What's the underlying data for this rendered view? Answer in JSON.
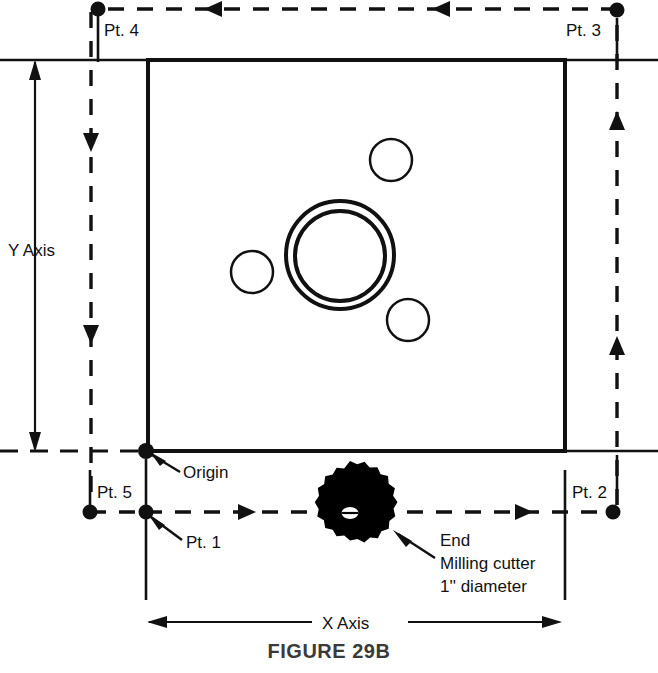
{
  "figure": {
    "caption": "FIGURE 29B",
    "type": "engineering-drawing"
  },
  "labels": {
    "pt4": "Pt. 4",
    "pt3": "Pt. 3",
    "pt5": "Pt. 5",
    "pt1": "Pt. 1",
    "pt2": "Pt. 2",
    "origin": "Origin",
    "y_axis": "Y Axis",
    "x_axis": "X Axis",
    "cutter_line1": "End",
    "cutter_line2": "Milling cutter",
    "cutter_line3": "1'' diameter"
  },
  "colors": {
    "line": "#111111",
    "caption": "#3a3a3a",
    "cutter_fill": "#000000",
    "background": "#ffffff"
  },
  "geometry": {
    "workpiece": {
      "x": 148,
      "y": 60,
      "width": 417,
      "height": 391
    },
    "origin_point": {
      "x": 146,
      "y": 451
    },
    "points": [
      {
        "name": "Pt. 1",
        "x": 146,
        "y": 512
      },
      {
        "name": "Pt. 2",
        "x": 613,
        "y": 512
      },
      {
        "name": "Pt. 3",
        "x": 617,
        "y": 10
      },
      {
        "name": "Pt. 4",
        "x": 98,
        "y": 9
      },
      {
        "name": "Pt. 5",
        "x": 90,
        "y": 512
      }
    ],
    "holes": [
      {
        "name": "large-bore-outer",
        "cx": 340,
        "cy": 255,
        "r": 54
      },
      {
        "name": "large-bore-inner",
        "cx": 340,
        "cy": 256,
        "r": 46
      },
      {
        "name": "small-hole-upper-right",
        "cx": 391,
        "cy": 160,
        "r": 21
      },
      {
        "name": "small-hole-left",
        "cx": 252,
        "cy": 272,
        "r": 21
      },
      {
        "name": "small-hole-lower-right",
        "cx": 408,
        "cy": 320,
        "r": 21
      }
    ],
    "cutter": {
      "cx": 350,
      "cy": 513,
      "r_outer": 52,
      "r_inner": 43,
      "teeth": 23
    },
    "x_axis_dimension": {
      "x1": 147,
      "x2": 560,
      "y": 622
    },
    "y_axis_dimension": {
      "x": 35,
      "y1": 60,
      "y2": 451
    }
  }
}
